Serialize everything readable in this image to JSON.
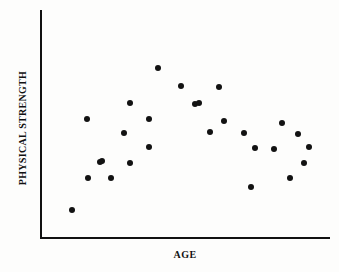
{
  "chart_data": {
    "type": "scatter",
    "title": "",
    "xlabel": "AGE",
    "ylabel": "PHYSICAL STRENGTH",
    "grid": false,
    "legend": null,
    "axis_style": "two-axis-lines-no-ticks",
    "xlim": [
      0,
      100
    ],
    "ylim": [
      0,
      100
    ],
    "xticks": [],
    "yticks": [],
    "marker": {
      "shape": "circle",
      "color": "#121212",
      "size_px": 6
    },
    "point_count": 27,
    "points": [
      {
        "x_px": 72,
        "y_px": 210,
        "x": 11.2,
        "y": 11.9
      },
      {
        "x_px": 87,
        "y_px": 119,
        "x": 16.4,
        "y": 51.9
      },
      {
        "x_px": 88,
        "y_px": 178,
        "x": 16.7,
        "y": 26.0
      },
      {
        "x_px": 100,
        "y_px": 162,
        "x": 20.9,
        "y": 33.0
      },
      {
        "x_px": 102,
        "y_px": 161,
        "x": 21.6,
        "y": 33.5
      },
      {
        "x_px": 111,
        "y_px": 178,
        "x": 24.7,
        "y": 26.0
      },
      {
        "x_px": 124,
        "y_px": 133,
        "x": 29.3,
        "y": 45.8
      },
      {
        "x_px": 130,
        "y_px": 103,
        "x": 31.4,
        "y": 58.9
      },
      {
        "x_px": 130,
        "y_px": 163,
        "x": 31.4,
        "y": 32.6
      },
      {
        "x_px": 149,
        "y_px": 119,
        "x": 38.0,
        "y": 51.9
      },
      {
        "x_px": 149,
        "y_px": 147,
        "x": 38.0,
        "y": 39.6
      },
      {
        "x_px": 158,
        "y_px": 68,
        "x": 41.1,
        "y": 74.2
      },
      {
        "x_px": 181,
        "y_px": 86,
        "x": 49.1,
        "y": 66.3
      },
      {
        "x_px": 195,
        "y_px": 104,
        "x": 54.0,
        "y": 58.4
      },
      {
        "x_px": 199,
        "y_px": 103,
        "x": 55.4,
        "y": 58.9
      },
      {
        "x_px": 210,
        "y_px": 132,
        "x": 59.2,
        "y": 46.3
      },
      {
        "x_px": 219,
        "y_px": 87,
        "x": 62.3,
        "y": 65.9
      },
      {
        "x_px": 224,
        "y_px": 121,
        "x": 64.1,
        "y": 51.1
      },
      {
        "x_px": 244,
        "y_px": 133,
        "x": 71.0,
        "y": 45.8
      },
      {
        "x_px": 251,
        "y_px": 187,
        "x": 73.4,
        "y": 22.0
      },
      {
        "x_px": 255,
        "y_px": 148,
        "x": 74.8,
        "y": 39.2
      },
      {
        "x_px": 274,
        "y_px": 149,
        "x": 81.4,
        "y": 38.8
      },
      {
        "x_px": 282,
        "y_px": 123,
        "x": 84.2,
        "y": 50.2
      },
      {
        "x_px": 290,
        "y_px": 178,
        "x": 87.0,
        "y": 26.0
      },
      {
        "x_px": 298,
        "y_px": 134,
        "x": 89.8,
        "y": 45.4
      },
      {
        "x_px": 304,
        "y_px": 163,
        "x": 91.9,
        "y": 32.6
      },
      {
        "x_px": 309,
        "y_px": 147,
        "x": 93.7,
        "y": 39.6
      }
    ]
  }
}
